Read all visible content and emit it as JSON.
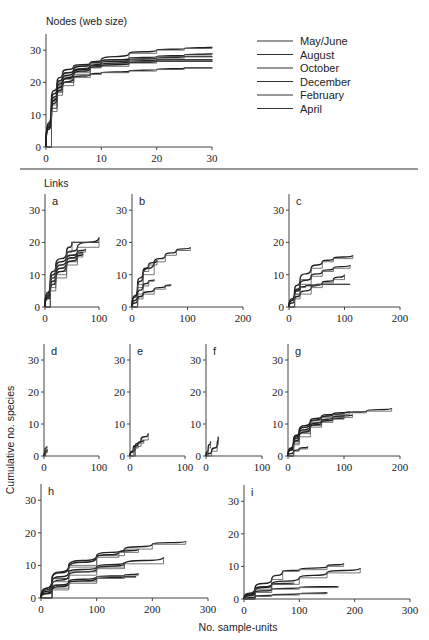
{
  "chart_data": [
    {
      "id": "nodes",
      "type": "line",
      "title": "Nodes (web size)",
      "xlabel": "No. sample-units",
      "ylabel": "Cumulative no. species",
      "xlim": [
        0,
        30
      ],
      "ylim": [
        0,
        35
      ],
      "xticks": [
        0,
        10,
        20,
        30
      ],
      "yticks": [
        0,
        10,
        20,
        30
      ],
      "legend": [
        "May/June",
        "August",
        "October",
        "December",
        "February",
        "April"
      ],
      "legend_position": "right",
      "series": [
        {
          "name": "curve1",
          "x": [
            0,
            1,
            2,
            3,
            5,
            8,
            10,
            15,
            20,
            25,
            30
          ],
          "values": [
            0,
            15,
            20,
            23,
            25,
            26,
            27,
            29,
            30,
            30.5,
            31
          ]
        },
        {
          "name": "curve2",
          "x": [
            0,
            1,
            2,
            3,
            5,
            8,
            10,
            15,
            20,
            25,
            30
          ],
          "values": [
            0,
            14,
            19,
            22,
            24,
            26,
            26.5,
            27.5,
            28,
            28.5,
            29
          ]
        },
        {
          "name": "curve3",
          "x": [
            0,
            1,
            2,
            3,
            5,
            8,
            10,
            15,
            20,
            25,
            30
          ],
          "values": [
            0,
            13,
            18,
            21,
            23.5,
            25,
            26,
            27,
            27.5,
            28,
            28
          ]
        },
        {
          "name": "curve4",
          "x": [
            0,
            1,
            2,
            3,
            5,
            8,
            10,
            15,
            20,
            25,
            30
          ],
          "values": [
            0,
            12,
            17,
            20,
            23,
            25,
            25.5,
            26.5,
            27,
            27,
            27
          ]
        },
        {
          "name": "curve5",
          "x": [
            0,
            1,
            2,
            3,
            5,
            8,
            10,
            15,
            20,
            25,
            30
          ],
          "values": [
            0,
            12,
            17,
            20,
            22.5,
            24.5,
            25,
            26,
            26.5,
            26.5,
            26.5
          ]
        },
        {
          "name": "curve6",
          "x": [
            0,
            1,
            2,
            3,
            5,
            8,
            10,
            15,
            20,
            25,
            30
          ],
          "values": [
            0,
            11,
            16,
            19,
            21.5,
            22.5,
            23,
            23.5,
            24,
            24.5,
            24.5
          ]
        }
      ]
    },
    {
      "id": "a",
      "type": "line",
      "panel_label": "a",
      "group": "Links",
      "xlim": [
        0,
        100
      ],
      "ylim": [
        0,
        35
      ],
      "xticks": [
        0,
        100
      ],
      "yticks": [
        0,
        10,
        20,
        30
      ],
      "series": [
        {
          "x": [
            0,
            10,
            20,
            40,
            60,
            100
          ],
          "values": [
            0,
            8,
            12,
            16,
            18.5,
            21.5
          ]
        },
        {
          "x": [
            0,
            10,
            20,
            40,
            60,
            75
          ],
          "values": [
            0,
            7,
            11,
            15,
            17,
            18
          ]
        },
        {
          "x": [
            0,
            10,
            20,
            40,
            60,
            70
          ],
          "values": [
            0,
            6,
            10,
            14,
            16.5,
            17
          ]
        },
        {
          "x": [
            0,
            10,
            20,
            40,
            60,
            70
          ],
          "values": [
            0,
            5,
            9,
            13,
            15.5,
            16.5
          ]
        },
        {
          "x": [
            0,
            10,
            20,
            40,
            50,
            100
          ],
          "values": [
            0,
            9,
            13,
            17,
            20,
            20
          ]
        }
      ]
    },
    {
      "id": "b",
      "type": "line",
      "panel_label": "b",
      "group": "Links",
      "xlim": [
        0,
        200
      ],
      "ylim": [
        0,
        35
      ],
      "xticks": [
        0,
        100,
        200
      ],
      "yticks": [
        0,
        10,
        20,
        30
      ],
      "series": [
        {
          "x": [
            0,
            10,
            20,
            40,
            60,
            80,
            105
          ],
          "values": [
            0,
            6,
            10,
            14,
            16,
            17.5,
            18.5
          ]
        },
        {
          "x": [
            0,
            10,
            20,
            30,
            45
          ],
          "values": [
            0,
            7,
            11,
            13,
            14.5
          ]
        },
        {
          "x": [
            0,
            10,
            20,
            30,
            40
          ],
          "values": [
            0,
            4,
            6.5,
            8,
            8.5
          ]
        },
        {
          "x": [
            0,
            10,
            20,
            40,
            60,
            70
          ],
          "values": [
            0,
            2.5,
            4,
            5.5,
            6.5,
            7
          ]
        }
      ]
    },
    {
      "id": "c",
      "type": "line",
      "panel_label": "c",
      "group": "Links",
      "xlim": [
        0,
        200
      ],
      "ylim": [
        0,
        35
      ],
      "xticks": [
        0,
        100,
        200
      ],
      "yticks": [
        0,
        10,
        20,
        30
      ],
      "series": [
        {
          "x": [
            0,
            10,
            20,
            40,
            60,
            80,
            115
          ],
          "values": [
            0,
            5,
            8.5,
            12,
            14,
            15,
            16
          ]
        },
        {
          "x": [
            0,
            10,
            20,
            40,
            60,
            80,
            110
          ],
          "values": [
            0,
            4,
            7,
            9.5,
            11,
            12,
            13
          ]
        },
        {
          "x": [
            0,
            10,
            20,
            40,
            60,
            80,
            100
          ],
          "values": [
            0,
            2.5,
            4,
            6,
            7.5,
            8.5,
            10
          ]
        },
        {
          "x": [
            0,
            10,
            20,
            30,
            50,
            80,
            110
          ],
          "values": [
            0,
            4,
            6,
            6.5,
            7,
            7,
            7
          ]
        }
      ]
    },
    {
      "id": "d",
      "type": "line",
      "panel_label": "d",
      "group": "Links",
      "xlim": [
        0,
        100
      ],
      "ylim": [
        0,
        35
      ],
      "xticks": [
        0,
        100
      ],
      "yticks": [
        0,
        10,
        20,
        30
      ],
      "series": [
        {
          "x": [
            0,
            2,
            5
          ],
          "values": [
            0,
            2,
            3
          ]
        },
        {
          "x": [
            0,
            3,
            6
          ],
          "values": [
            0,
            1,
            2
          ]
        }
      ]
    },
    {
      "id": "e",
      "type": "line",
      "panel_label": "e",
      "group": "Links",
      "xlim": [
        0,
        100
      ],
      "ylim": [
        0,
        35
      ],
      "xticks": [
        0,
        100
      ],
      "yticks": [
        0,
        10,
        20,
        30
      ],
      "series": [
        {
          "x": [
            0,
            10,
            20,
            33
          ],
          "values": [
            0,
            3,
            5,
            7
          ]
        },
        {
          "x": [
            0,
            8,
            15,
            25
          ],
          "values": [
            0,
            2.5,
            4,
            5
          ]
        },
        {
          "x": [
            0,
            6,
            12
          ],
          "values": [
            0,
            2.5,
            4
          ]
        }
      ]
    },
    {
      "id": "f",
      "type": "line",
      "panel_label": "f",
      "group": "Links",
      "xlim": [
        0,
        100
      ],
      "ylim": [
        0,
        35
      ],
      "xticks": [
        0,
        100
      ],
      "yticks": [
        0,
        10,
        20,
        30
      ],
      "series": [
        {
          "x": [
            0,
            4,
            8
          ],
          "values": [
            0,
            2.5,
            4.5
          ]
        },
        {
          "x": [
            0,
            10,
            20,
            22
          ],
          "values": [
            0,
            1.5,
            3.5,
            6
          ]
        }
      ]
    },
    {
      "id": "g",
      "type": "line",
      "panel_label": "g",
      "group": "Links",
      "xlim": [
        0,
        200
      ],
      "ylim": [
        0,
        35
      ],
      "xticks": [
        0,
        100,
        200
      ],
      "yticks": [
        0,
        10,
        20,
        30
      ],
      "series": [
        {
          "x": [
            0,
            10,
            20,
            40,
            60,
            100,
            140,
            185
          ],
          "values": [
            0,
            5,
            8,
            11,
            12.5,
            13.5,
            14,
            15
          ]
        },
        {
          "x": [
            0,
            10,
            20,
            40,
            60,
            80,
            110
          ],
          "values": [
            0,
            4.5,
            7.5,
            10.5,
            12,
            13,
            14
          ]
        },
        {
          "x": [
            0,
            10,
            20,
            40,
            60,
            80,
            115
          ],
          "values": [
            0,
            4,
            7,
            9.5,
            11,
            12,
            13
          ]
        },
        {
          "x": [
            0,
            10,
            20,
            40,
            60,
            80,
            100
          ],
          "values": [
            0,
            3.5,
            6,
            9,
            10.5,
            11.5,
            12
          ]
        },
        {
          "x": [
            0,
            10,
            20,
            35
          ],
          "values": [
            0,
            1.5,
            2.2,
            3
          ]
        }
      ]
    },
    {
      "id": "h",
      "type": "line",
      "panel_label": "h",
      "group": "Links",
      "xlim": [
        0,
        300
      ],
      "ylim": [
        0,
        35
      ],
      "xticks": [
        0,
        100,
        200,
        300
      ],
      "yticks": [
        0,
        10,
        20,
        30
      ],
      "series": [
        {
          "x": [
            0,
            20,
            50,
            100,
            150,
            200,
            260
          ],
          "values": [
            0,
            6,
            10,
            13,
            15,
            16.5,
            17.5
          ]
        },
        {
          "x": [
            0,
            20,
            50,
            100,
            140,
            175
          ],
          "values": [
            0,
            6,
            9.5,
            12.5,
            14,
            15
          ]
        },
        {
          "x": [
            0,
            20,
            50,
            100,
            150,
            220
          ],
          "values": [
            0,
            4,
            7,
            9,
            10.5,
            12.5
          ]
        },
        {
          "x": [
            0,
            20,
            50,
            100,
            150
          ],
          "values": [
            0,
            5,
            8,
            9.5,
            11
          ]
        },
        {
          "x": [
            0,
            20,
            50,
            100,
            150,
            175
          ],
          "values": [
            0,
            3,
            5,
            6.5,
            7,
            7.5
          ]
        },
        {
          "x": [
            0,
            20,
            50,
            100,
            150,
            170
          ],
          "values": [
            0,
            2.5,
            4.5,
            6,
            6.5,
            6.5
          ]
        }
      ]
    },
    {
      "id": "i",
      "type": "line",
      "panel_label": "i",
      "group": "Links",
      "xlim": [
        0,
        300
      ],
      "ylim": [
        0,
        35
      ],
      "xticks": [
        0,
        100,
        200,
        300
      ],
      "yticks": [
        0,
        10,
        20,
        30
      ],
      "series": [
        {
          "x": [
            0,
            20,
            50,
            70,
            100,
            150,
            180
          ],
          "values": [
            0,
            3.5,
            6,
            8.5,
            9,
            10,
            11
          ]
        },
        {
          "x": [
            0,
            20,
            50,
            100,
            150,
            210
          ],
          "values": [
            0,
            2.5,
            4.5,
            6.5,
            8,
            9.5
          ]
        },
        {
          "x": [
            0,
            20,
            50,
            90
          ],
          "values": [
            0,
            3,
            4.5,
            5
          ]
        },
        {
          "x": [
            0,
            20,
            50,
            100,
            170
          ],
          "values": [
            0,
            2,
            3,
            3.5,
            4
          ]
        },
        {
          "x": [
            0,
            20,
            50,
            100,
            150
          ],
          "values": [
            0,
            0.8,
            1.2,
            1.6,
            2
          ]
        }
      ]
    }
  ],
  "labels": {
    "nodes_title": "Nodes (web size)",
    "links_title": "Links",
    "ylabel": "Cumulative no. species",
    "xlabel": "No. sample-units",
    "legend": [
      "May/June",
      "August",
      "October",
      "December",
      "February",
      "April"
    ],
    "panels": [
      "a",
      "b",
      "c",
      "d",
      "e",
      "f",
      "g",
      "h",
      "i"
    ]
  }
}
